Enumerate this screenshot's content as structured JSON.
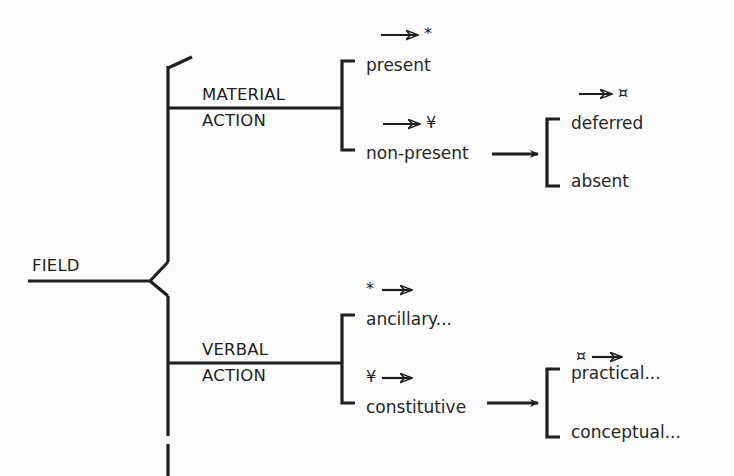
{
  "diagram": {
    "title": "FIELD",
    "type": "system-network",
    "colors": {
      "line": "#1f1f1f",
      "text": "#262626",
      "background": "#fbfbfb"
    },
    "entry": {
      "label": "FIELD"
    },
    "systems": [
      {
        "id": "material-action",
        "name_line1": "MATERIAL",
        "name_line2": "ACTION",
        "terms": [
          {
            "id": "present",
            "label": "present",
            "marker_symbol": "*",
            "marker_order": "arrow-then-symbol"
          },
          {
            "id": "non-present",
            "label": "non-present",
            "marker_symbol": "¥",
            "marker_order": "arrow-then-symbol"
          }
        ]
      },
      {
        "id": "deferred-absent",
        "name_line1": "",
        "name_line2": "",
        "terms": [
          {
            "id": "deferred",
            "label": "deferred",
            "marker_symbol": "¤",
            "marker_order": "arrow-then-symbol"
          },
          {
            "id": "absent",
            "label": "absent",
            "marker_symbol": "",
            "marker_order": "none"
          }
        ]
      },
      {
        "id": "verbal-action",
        "name_line1": "VERBAL",
        "name_line2": "ACTION",
        "terms": [
          {
            "id": "ancillary",
            "label": "ancillary...",
            "marker_symbol": "*",
            "marker_order": "symbol-then-arrow"
          },
          {
            "id": "constitutive",
            "label": "constitutive",
            "marker_symbol": "¥",
            "marker_order": "symbol-then-arrow"
          }
        ]
      },
      {
        "id": "practical-conceptual",
        "name_line1": "",
        "name_line2": "",
        "terms": [
          {
            "id": "practical",
            "label": "practical...",
            "marker_symbol": "¤",
            "marker_order": "symbol-then-arrow"
          },
          {
            "id": "conceptual",
            "label": "conceptual...",
            "marker_symbol": "",
            "marker_order": "none"
          }
        ]
      }
    ],
    "labels": {
      "field": "FIELD",
      "material": "MATERIAL",
      "action_upper": "ACTION",
      "verbal": "VERBAL",
      "action_lower": "ACTION",
      "present": "present",
      "non_present": "non-present",
      "deferred": "deferred",
      "absent": "absent",
      "ancillary": "ancillary...",
      "constitutive": "constitutive",
      "practical": "practical...",
      "conceptual": "conceptual..."
    },
    "markers": {
      "present_symbol": "*",
      "non_present_symbol": "¥",
      "deferred_symbol": "¤",
      "ancillary_symbol": "*",
      "constitutive_symbol": "¥",
      "practical_symbol": "¤"
    }
  }
}
